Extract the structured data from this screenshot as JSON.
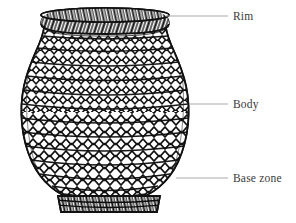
{
  "figure": {
    "type": "archaeological-vessel-line-drawing",
    "background_color": "#ffffff",
    "ink_color": "#111111",
    "leader_line_color": "#a9a9a9",
    "label_color": "#3a3a3a",
    "surface_treatment": "twined net / cord-wrapped mesh impression"
  },
  "annotations": [
    {
      "id": "rim",
      "label": "Rim",
      "leader": {
        "x1": 166,
        "y1": 16,
        "x2": 228,
        "y2": 16
      },
      "text_position": {
        "x": 233,
        "y": 11
      }
    },
    {
      "id": "body",
      "label": "Body",
      "leader": {
        "x1": 189,
        "y1": 104,
        "x2": 228,
        "y2": 104
      },
      "text_position": {
        "x": 233,
        "y": 99
      }
    },
    {
      "id": "base-zone",
      "label": "Base zone",
      "leader": {
        "x1": 176,
        "y1": 178,
        "x2": 228,
        "y2": 178
      },
      "text_position": {
        "x": 233,
        "y": 173
      }
    }
  ],
  "vessel_geometry": {
    "rim_left": 40,
    "rim_right": 170,
    "rim_top": 10,
    "rim_bottom": 26,
    "neck_left": 44,
    "neck_right": 166,
    "shoulder_y": 62,
    "max_width_y": 120,
    "max_left": 22,
    "max_right": 190,
    "base_ring_left": 58,
    "base_ring_right": 160,
    "base_top": 196,
    "base_bottom": 212
  }
}
